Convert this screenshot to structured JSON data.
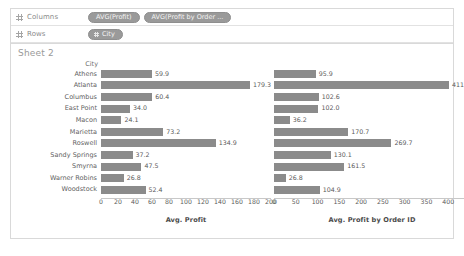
{
  "shelves": {
    "columns": {
      "label": "Columns",
      "pills": [
        {
          "text": "AVG(Profit)",
          "type": "measure"
        },
        {
          "text": "AVG(Profit by Order ...",
          "type": "measure"
        }
      ]
    },
    "rows": {
      "label": "Rows",
      "pills": [
        {
          "text": "City",
          "type": "dimension"
        }
      ]
    }
  },
  "view": {
    "sheet_title": "Sheet 2",
    "row_header": "City"
  },
  "chart_data": {
    "type": "bar",
    "title": "Sheet 2",
    "orientation": "horizontal",
    "grid": false,
    "legend": false,
    "categories": [
      "Athens",
      "Atlanta",
      "Columbus",
      "East Point",
      "Macon",
      "Marietta",
      "Roswell",
      "Sandy Springs",
      "Smyrna",
      "Warner Robins",
      "Woodstock"
    ],
    "ylabel": "City",
    "panels": [
      {
        "name": "avg-profit",
        "xlabel": "Avg. Profit",
        "xlim": [
          0,
          200
        ],
        "ticks": [
          0,
          20,
          40,
          60,
          80,
          100,
          120,
          140,
          160,
          180,
          200
        ],
        "values": [
          59.9,
          179.3,
          60.4,
          34.0,
          24.1,
          73.2,
          134.9,
          37.2,
          47.5,
          26.8,
          52.4
        ],
        "labels": [
          "59.9",
          "179.3",
          "60.4",
          "34.0",
          "24.1",
          "73.2",
          "134.9",
          "37.2",
          "47.5",
          "26.8",
          "52.4"
        ]
      },
      {
        "name": "avg-profit-by-order-id",
        "xlabel": "Avg. Profit by Order ID",
        "xlim": [
          0,
          450
        ],
        "ticks": [
          0,
          50,
          100,
          150,
          200,
          250,
          300,
          350,
          400,
          450
        ],
        "values": [
          95.9,
          411.4,
          102.6,
          102.0,
          36.2,
          170.7,
          269.7,
          130.1,
          161.5,
          26.8,
          104.9
        ],
        "labels": [
          "95.9",
          "411.4",
          "102.6",
          "102.0",
          "36.2",
          "170.7",
          "269.7",
          "130.1",
          "161.5",
          "26.8",
          "104.9"
        ]
      }
    ],
    "colors": {
      "bar": "#8b8b8b",
      "text": "#5a5a5a",
      "axis": "#c8c8c8"
    }
  }
}
